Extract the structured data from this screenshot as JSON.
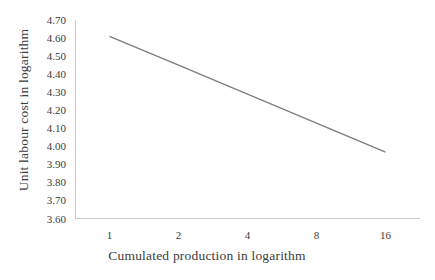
{
  "chart_data": {
    "type": "line",
    "title": "",
    "xlabel": "Cumulated production in logarithm",
    "ylabel": "Unit labour cost in logarithm",
    "categories": [
      "1",
      "2",
      "4",
      "8",
      "16"
    ],
    "values": [
      4.61,
      4.45,
      4.29,
      4.13,
      3.97
    ],
    "x_scale": "logarithmic (base-2 spaced categories)",
    "ylim": [
      3.6,
      4.7
    ],
    "ytick_step": 0.1,
    "ytick_labels": [
      "4.70",
      "4.60",
      "4.50",
      "4.40",
      "4.30",
      "4.20",
      "4.10",
      "4.00",
      "3.90",
      "3.80",
      "3.70",
      "3.60"
    ],
    "grid": false,
    "legend": "none",
    "colors": {
      "background": "#ffffff",
      "line": "#7d7d7d",
      "axis": "#c9c9c9",
      "text": "#3c3c3c"
    }
  }
}
